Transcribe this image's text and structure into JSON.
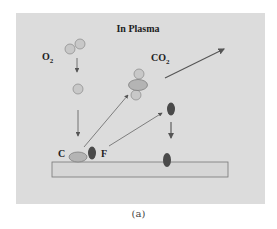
{
  "diagram": {
    "title": "In Plasma",
    "labels": {
      "o2": "O",
      "o2_sub": "2",
      "co2": "CO",
      "co2_sub": "2",
      "c": "C",
      "f": "F"
    },
    "caption": "(a)",
    "colors": {
      "background": "#dcdcdc",
      "o2_circle": "#c8c8c8",
      "c_ellipse": "#b4b4b4",
      "f_ellipse": "#4a4a4a",
      "membrane": "#d6d6d6",
      "arrow": "#555555"
    }
  }
}
